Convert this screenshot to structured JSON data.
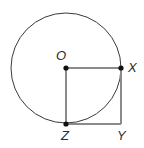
{
  "figure": {
    "background_color": "#ffffff",
    "width": 144,
    "height": 148,
    "circle": {
      "name": "circle-O",
      "center_x": 66,
      "center_y": 68,
      "radius": 55,
      "stroke_color": "#3a3a3a",
      "stroke_width": 1,
      "fill": "none"
    },
    "points": [
      {
        "id": "O",
        "label": "O",
        "x": 66,
        "y": 68,
        "dot": true,
        "dot_radius": 2.6,
        "role": "center"
      },
      {
        "id": "X",
        "label": "X",
        "x": 121,
        "y": 68,
        "dot": true,
        "dot_radius": 2.6,
        "role": "on-circle"
      },
      {
        "id": "Z",
        "label": "Z",
        "x": 66,
        "y": 124,
        "dot": true,
        "dot_radius": 2.6,
        "role": "on-circle"
      },
      {
        "id": "Y",
        "label": "Y",
        "x": 121,
        "y": 124,
        "dot": false,
        "dot_radius": 0,
        "role": "corner"
      }
    ],
    "segments": [
      {
        "id": "OX",
        "from": "O",
        "to": "X",
        "x1": 66,
        "y1": 68,
        "x2": 121,
        "y2": 68,
        "stroke_color": "#8a8a8a",
        "stroke_width": 2
      },
      {
        "id": "OZ",
        "from": "O",
        "to": "Z",
        "x1": 66,
        "y1": 68,
        "x2": 66,
        "y2": 124,
        "stroke_color": "#8a8a8a",
        "stroke_width": 2
      },
      {
        "id": "XY",
        "from": "X",
        "to": "Y",
        "x1": 121,
        "y1": 68,
        "x2": 121,
        "y2": 124,
        "stroke_color": "#8a8a8a",
        "stroke_width": 2
      },
      {
        "id": "ZY",
        "from": "Z",
        "to": "Y",
        "x1": 66,
        "y1": 124,
        "x2": 121,
        "y2": 124,
        "stroke_color": "#8a8a8a",
        "stroke_width": 2
      }
    ],
    "dot_color": "#111111",
    "label_color": "#2b2b2b"
  }
}
